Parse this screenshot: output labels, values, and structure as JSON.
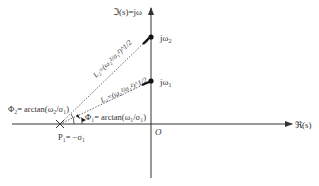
{
  "diagram": {
    "imag_axis_label": "ℑ(s)=jω",
    "real_axis_label": "ℜ(s)",
    "origin_label": "O",
    "point_high_label": "jω",
    "point_high_sub": "2",
    "point_low_label": "jω",
    "point_low_sub": "1",
    "L2_label": "L₂=(ω₂²/σ₁²)^1/2",
    "L1_label": "L₁=(ω₁²/σ₁²)^1/2",
    "phi2_label": "Φ₂= arctan(ω₂/σ₁)",
    "phi1_label": "Φ₁= arctan(ω₁/σ₁)",
    "pole_label": "P₁= −σ₁",
    "colors": {
      "axis": "#333333",
      "dotted": "#555555",
      "point": "#111111"
    }
  }
}
